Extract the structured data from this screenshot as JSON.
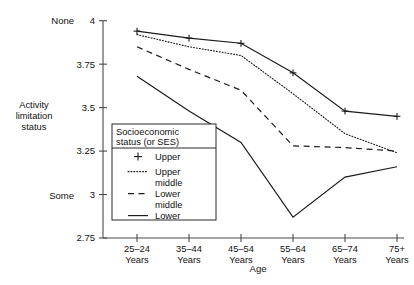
{
  "chart_data": {
    "type": "line",
    "title": "",
    "xlabel": "Age",
    "ylabel": "Activity limitation status",
    "categories": [
      "25–24 Years",
      "35–44 Years",
      "45–54 Years",
      "55–64 Years",
      "65–74 Years",
      "75+ Years"
    ],
    "category_lines": [
      [
        "25–24",
        "Years"
      ],
      [
        "35–44",
        "Years"
      ],
      [
        "45–54",
        "Years"
      ],
      [
        "55–64",
        "Years"
      ],
      [
        "65–74",
        "Years"
      ],
      [
        "75+",
        "Years"
      ]
    ],
    "ylim": [
      2.75,
      4
    ],
    "yticks": [
      4,
      3.75,
      3.5,
      3.25,
      3,
      2.75
    ],
    "ytick_labels": [
      "4",
      "3.75",
      "3.5",
      "3.25",
      "3",
      "2.75"
    ],
    "y_axis_end_labels": {
      "top": "None",
      "top_value": 4,
      "bottom": "Some",
      "bottom_value": 3
    },
    "grid": false,
    "legend_position": "inside-bottom-left",
    "series": [
      {
        "name": "Upper",
        "style": "solid-with-plus-markers",
        "markers": "plus",
        "values": [
          3.94,
          3.9,
          3.87,
          3.7,
          3.48,
          3.45
        ]
      },
      {
        "name": "Upper middle",
        "style": "dotted",
        "markers": "none",
        "values": [
          3.92,
          3.85,
          3.8,
          3.58,
          3.35,
          3.24
        ]
      },
      {
        "name": "Lower middle",
        "style": "dashed",
        "markers": "none",
        "values": [
          3.85,
          3.72,
          3.6,
          3.28,
          3.27,
          3.25
        ]
      },
      {
        "name": "Lower",
        "style": "solid",
        "markers": "none",
        "values": [
          3.68,
          3.48,
          3.3,
          2.87,
          3.1,
          3.16
        ]
      }
    ]
  },
  "legend": {
    "title_lines": [
      "Socioeconomic",
      "status (or SES)"
    ],
    "entries": [
      {
        "label_lines": [
          "Upper"
        ],
        "style": "solid-with-plus-markers"
      },
      {
        "label_lines": [
          "Upper",
          "middle"
        ],
        "style": "dotted"
      },
      {
        "label_lines": [
          "Lower",
          "middle"
        ],
        "style": "dashed"
      },
      {
        "label_lines": [
          "Lower"
        ],
        "style": "solid"
      }
    ]
  },
  "axis_label_lines": {
    "y": [
      "Activity",
      "limitation",
      "status"
    ],
    "x": "Age"
  },
  "colors": {
    "ink": "#1a1a1a",
    "axis": "#4a4a4a",
    "background": "#ffffff"
  }
}
